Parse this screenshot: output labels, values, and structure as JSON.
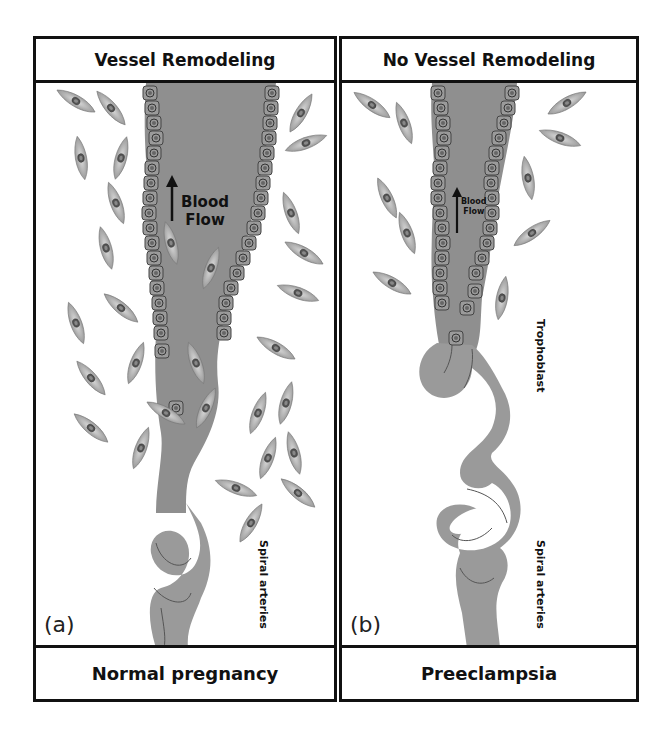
{
  "figure": {
    "panels": [
      {
        "id": "a",
        "letter": "(a)",
        "header": "Vessel Remodeling",
        "footer": "Normal pregnancy",
        "flow_label_line1": "Blood",
        "flow_label_line2": "Flow",
        "spiral_label": "Spiral arteries"
      },
      {
        "id": "b",
        "letter": "(b)",
        "header": "No Vessel Remodeling",
        "footer": "Preeclampsia",
        "flow_label_line1": "Blood",
        "flow_label_line2": "Flow",
        "trophoblast_label": "Trophoblast",
        "spiral_label": "Spiral arteries"
      }
    ],
    "colors": {
      "vessel": "#8f8f8f",
      "cell_fill": "#bdbdbd",
      "border": "#111111"
    }
  }
}
